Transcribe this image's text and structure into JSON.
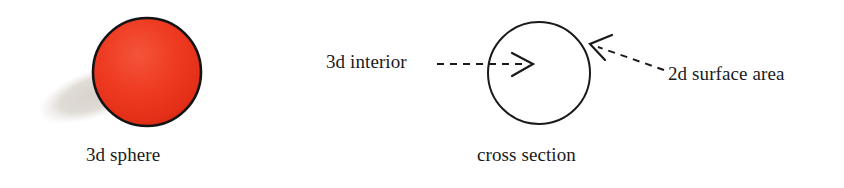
{
  "figure": {
    "width": 844,
    "height": 188,
    "background_color": "#ffffff",
    "ink_color": "#1a1a1a"
  },
  "sphere_panel": {
    "caption": "3d sphere",
    "sphere": {
      "name": "red-sphere",
      "center_x": 147,
      "center_y": 72,
      "radius": 54,
      "fill_color": "#ee3b22",
      "highlight_color": "#f4543a",
      "shade_color": "#d62b17",
      "outline_color": "#141414",
      "outline_width": 2.5
    },
    "shadow": {
      "name": "sphere-drop-shadow",
      "center_x": 97,
      "center_y": 93,
      "radius_x": 62,
      "radius_y": 24,
      "rotation_deg": -20,
      "fill_color": "#ddd8d2"
    }
  },
  "cross_section_panel": {
    "caption": "cross section",
    "circle": {
      "name": "cross-section-circle",
      "center_x": 539,
      "center_y": 73,
      "radius": 51,
      "stroke_color": "#1a1a1a",
      "stroke_width": 2,
      "fill": "none"
    },
    "annotations": [
      {
        "id": "interior",
        "label": "3d interior",
        "arrow_name": "interior-dashed-arrow",
        "direction": "right",
        "start_x": 437,
        "start_y": 64,
        "end_x": 531,
        "end_y": 64,
        "dash_pattern": "7,6",
        "stroke_color": "#1a1a1a",
        "stroke_width": 2
      },
      {
        "id": "surface",
        "label": "2d surface area",
        "arrow_name": "surface-area-dashed-arrow",
        "direction": "left",
        "start_x": 664,
        "start_y": 70,
        "end_x": 591,
        "end_y": 44,
        "dash_pattern": "7,6",
        "stroke_color": "#1a1a1a",
        "stroke_width": 2
      }
    ]
  }
}
